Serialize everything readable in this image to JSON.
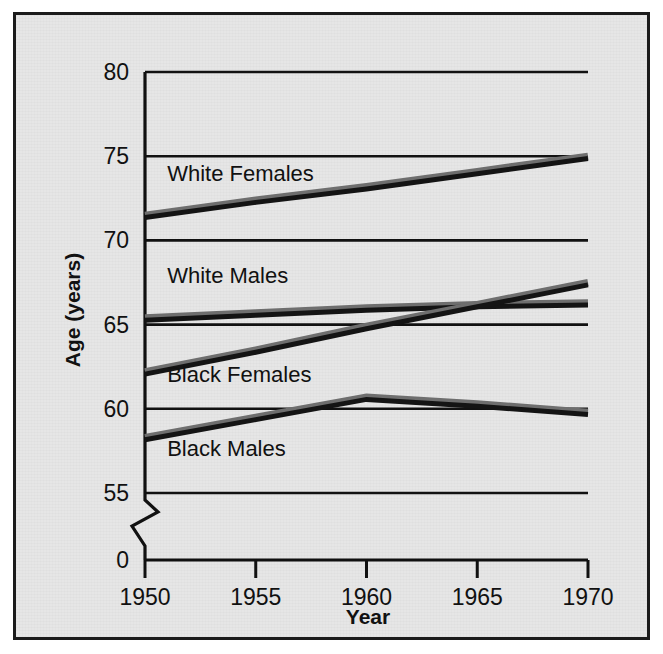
{
  "figure": {
    "background_color": "#e6e6e6",
    "border_color": "#1b1b1b",
    "page_color": "#ffffff"
  },
  "chart_data": {
    "type": "line",
    "title": "",
    "xlabel": "Year",
    "ylabel": "Age (years)",
    "x": [
      1950,
      1955,
      1960,
      1965,
      1970
    ],
    "xticklabels": [
      "1950",
      "1955",
      "1960",
      "1965",
      "1970"
    ],
    "yticks": [
      0,
      55,
      60,
      65,
      70,
      75,
      80
    ],
    "yticklabels": [
      "0",
      "55",
      "60",
      "65",
      "70",
      "75",
      "80"
    ],
    "ylim": [
      55,
      80
    ],
    "xlim": [
      1950,
      1970
    ],
    "axis_break": true,
    "axis_break_symbol": "zigzag",
    "grid": true,
    "grid_axis": "y",
    "legend": "inline-labels",
    "series": [
      {
        "name": "White Females",
        "values": [
          71.5,
          72.4,
          73.2,
          74.1,
          75.0
        ],
        "color_top": "#6e6e6e",
        "color_bottom": "#141414",
        "label_x": 1951.0,
        "label_y": 73.55
      },
      {
        "name": "White Males",
        "values": [
          65.4,
          65.7,
          66.0,
          66.2,
          66.3
        ],
        "color_top": "#6e6e6e",
        "color_bottom": "#141414",
        "label_x": 1951.0,
        "label_y": 67.45
      },
      {
        "name": "Black Females",
        "values": [
          62.2,
          63.5,
          64.9,
          66.2,
          67.5
        ],
        "color_top": "#6e6e6e",
        "color_bottom": "#141414",
        "label_x": 1951.0,
        "label_y": 61.6
      },
      {
        "name": "Black Males",
        "values": [
          58.3,
          59.5,
          60.7,
          60.3,
          59.8
        ],
        "color_top": "#6e6e6e",
        "color_bottom": "#141414",
        "label_x": 1951.0,
        "label_y": 57.2
      }
    ],
    "annotations": [
      "White Females",
      "White Males",
      "Black Females",
      "Black Males"
    ]
  }
}
